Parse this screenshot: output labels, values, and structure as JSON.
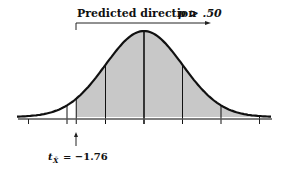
{
  "diagram": {
    "type": "normal-distribution",
    "header_label": "Predicted direction",
    "p_label": "p > .50",
    "t_label": "t",
    "t_subscript": "X̄",
    "t_value": "= −1.76",
    "critical_z": -1.76,
    "shaded_region": "right of t = -1.76",
    "tick_positions_sd": [
      -3,
      -2,
      -1,
      0,
      1,
      2,
      3
    ],
    "colors": {
      "curve": "#111111",
      "fill": "#c8c8c8",
      "axis": "#444444"
    }
  }
}
